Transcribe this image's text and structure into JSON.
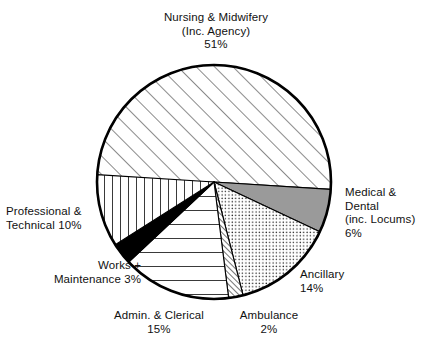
{
  "chart_data": {
    "type": "pie",
    "title": "",
    "subtitle": "",
    "xlabel": "",
    "ylabel": "",
    "legend_position": "none",
    "grid": false,
    "units": "percent",
    "start_angle_deg": 180,
    "direction": "clockwise",
    "categories": [
      "Nursing & Midwifery (Inc. Agency)",
      "Medical & Dental (inc. Locums)",
      "Ancillary",
      "Ambulance",
      "Admin. & Clerical",
      "Works + Maintenance",
      "Professional & Technical"
    ],
    "values": [
      51,
      6,
      14,
      2,
      15,
      3,
      10
    ],
    "slices": [
      {
        "key": "nursing",
        "name": "Nursing & Midwifery (Inc. Agency)",
        "value": 51,
        "percent_text": "51%",
        "fill": "diagonal-hatch-wide",
        "color": "#ffffff",
        "stroke": "#000000",
        "start_deg": 180,
        "end_deg": 363.6
      },
      {
        "key": "medical",
        "name": "Medical & Dental (inc. Locums)",
        "value": 6,
        "percent_text": "6%",
        "fill": "solid-gray",
        "color": "#9a9a9a",
        "stroke": "#000000",
        "start_deg": 3.6,
        "end_deg": 25.2
      },
      {
        "key": "ancillary",
        "name": "Ancillary",
        "value": 14,
        "percent_text": "14%",
        "fill": "dotted-stipple",
        "color": "#ffffff",
        "stroke": "#000000",
        "start_deg": 25.2,
        "end_deg": 75.6
      },
      {
        "key": "ambulance",
        "name": "Ambulance",
        "value": 2,
        "percent_text": "2%",
        "fill": "dense-diagonal-hatch",
        "color": "#ffffff",
        "stroke": "#000000",
        "start_deg": 75.6,
        "end_deg": 82.8
      },
      {
        "key": "admin",
        "name": "Admin. & Clerical",
        "value": 15,
        "percent_text": "15%",
        "fill": "horizontal-lines",
        "color": "#ffffff",
        "stroke": "#000000",
        "start_deg": 82.8,
        "end_deg": 136.8
      },
      {
        "key": "works",
        "name": "Works + Maintenance",
        "value": 3,
        "percent_text": "3%",
        "fill": "solid-black",
        "color": "#000000",
        "stroke": "#000000",
        "start_deg": 136.8,
        "end_deg": 147.6
      },
      {
        "key": "professional",
        "name": "Professional & Technical",
        "value": 10,
        "percent_text": "10%",
        "fill": "vertical-lines",
        "color": "#ffffff",
        "stroke": "#000000",
        "start_deg": 147.6,
        "end_deg": 180
      }
    ]
  },
  "labels": {
    "nursing": "Nursing & Midwifery\n(Inc. Agency)\n51%",
    "medical": "Medical &\nDental\n(inc. Locums)\n6%",
    "ancillary": "Ancillary\n14%",
    "ambulance": "Ambulance\n2%",
    "admin": "Admin. & Clerical\n15%",
    "works": "Works +\nMaintenance 3%",
    "professional": "Professional &\nTechnical 10%"
  },
  "colors": {
    "outline": "#000000",
    "background": "#ffffff",
    "medical_gray": "#9a9a9a",
    "works_black": "#000000",
    "text": "#111111"
  }
}
